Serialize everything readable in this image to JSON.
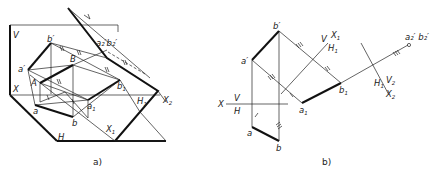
{
  "figure_a": {
    "caption": "a)",
    "labels": {
      "V": "V",
      "H": "H",
      "X": "X",
      "X1": "X",
      "X1_sub": "1",
      "X2": "X",
      "X2_sub": "2",
      "H1": "H",
      "H1_sub": "1",
      "b_prime": "b′",
      "a_prime": "a′",
      "A": "A",
      "B": "B",
      "a": "a",
      "b": "b",
      "a1": "a",
      "a1_sub": "1",
      "b1": "b",
      "b1_sub": "1",
      "a2b2": "a₂′b₂′",
      "V1": "V",
      "V1_sub": "1"
    }
  },
  "figure_b": {
    "caption": "b)",
    "labels": {
      "X": "X",
      "V": "V",
      "H": "H",
      "a_prime": "a′",
      "b_prime": "b′",
      "a": "a",
      "b": "b",
      "a1": "a",
      "a1_sub": "1",
      "b1": "b",
      "b1_sub": "1",
      "V_axis1": "V",
      "H1": "H",
      "H1_sub": "1",
      "X1": "X",
      "X1_sub": "1",
      "H1b": "H",
      "H1b_sub": "1",
      "V2": "V",
      "V2_sub": "2",
      "X2": "X",
      "X2_sub": "2",
      "a2b2": "a₂′ b₂′"
    }
  }
}
